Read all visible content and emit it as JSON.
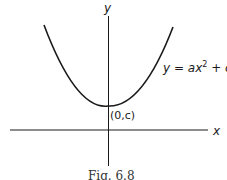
{
  "figure": {
    "caption": "Fig. 6.8",
    "axes": {
      "x_label": "x",
      "y_label": "y"
    },
    "curve": {
      "equation_lhs": "y = ax",
      "equation_exp": "2",
      "equation_rhs": " + c",
      "type": "parabola",
      "opens": "up"
    },
    "vertex_label": "(0,c)",
    "colors": {
      "ink": "#1a1a1a",
      "background": "#ffffff"
    }
  }
}
